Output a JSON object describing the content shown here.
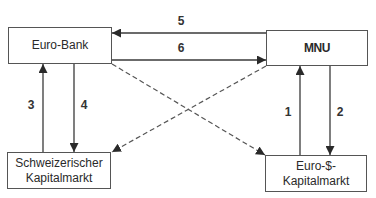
{
  "diagram": {
    "nodes": [
      {
        "id": "euro-bank",
        "label": "Euro-Bank",
        "x": 8,
        "y": 27,
        "w": 104,
        "h": 37
      },
      {
        "id": "mnu",
        "label": "MNU",
        "x": 266,
        "y": 30,
        "w": 102,
        "h": 36
      },
      {
        "id": "schweizerischer-kapitalmarkt",
        "label": "Schweizerischer\nKapitalmarkt",
        "x": 7,
        "y": 152,
        "w": 104,
        "h": 37
      },
      {
        "id": "euro-dollar-kapitalmarkt",
        "label": "Euro-$-\nKapitalmarkt",
        "x": 265,
        "y": 155,
        "w": 102,
        "h": 37
      }
    ],
    "edges": [
      {
        "id": "1",
        "label": "1",
        "from": "euro-dollar-kapitalmarkt",
        "to": "mnu",
        "style": "solid"
      },
      {
        "id": "2",
        "label": "2",
        "from": "mnu",
        "to": "euro-dollar-kapitalmarkt",
        "style": "solid"
      },
      {
        "id": "3",
        "label": "3",
        "from": "schweizerischer-kapitalmarkt",
        "to": "euro-bank",
        "style": "solid"
      },
      {
        "id": "4",
        "label": "4",
        "from": "euro-bank",
        "to": "schweizerischer-kapitalmarkt",
        "style": "solid"
      },
      {
        "id": "5",
        "label": "5",
        "from": "mnu",
        "to": "euro-bank",
        "style": "solid"
      },
      {
        "id": "6",
        "label": "6",
        "from": "euro-bank",
        "to": "mnu",
        "style": "solid"
      },
      {
        "id": "d1",
        "label": "",
        "from": "euro-bank",
        "to": "euro-dollar-kapitalmarkt",
        "style": "dashed"
      },
      {
        "id": "d2",
        "label": "",
        "from": "mnu",
        "to": "schweizerischer-kapitalmarkt",
        "style": "dashed"
      }
    ],
    "colors": {
      "line": "#3a3a3a",
      "dashed": "#555555",
      "border": "#555555",
      "text": "#2a2a2a"
    }
  }
}
